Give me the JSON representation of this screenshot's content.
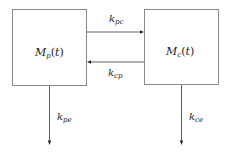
{
  "diagram": {
    "type": "two-compartment-model",
    "nodes": [
      {
        "id": "p",
        "main": "M",
        "sub": "p",
        "arg": "t"
      },
      {
        "id": "c",
        "main": "M",
        "sub": "c",
        "arg": "t"
      }
    ],
    "edges": [
      {
        "from": "p",
        "to": "c",
        "main": "k",
        "sub": "pc"
      },
      {
        "from": "c",
        "to": "p",
        "main": "k",
        "sub": "cp"
      },
      {
        "from": "p",
        "to": "elimination",
        "main": "k",
        "sub": "pe"
      },
      {
        "from": "c",
        "to": "elimination",
        "main": "k",
        "sub": "ce"
      }
    ],
    "colors": {
      "box_stroke": "#8a8a8a",
      "arrow": "#4a4a4a",
      "text": "#222222",
      "background": "#ffffff"
    }
  }
}
